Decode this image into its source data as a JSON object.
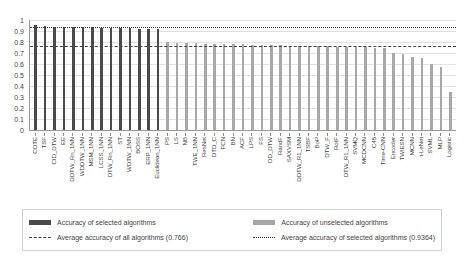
{
  "chart_data": {
    "type": "bar",
    "title": "",
    "xlabel": "",
    "ylabel": "",
    "ylim": [
      0,
      1
    ],
    "grid": true,
    "y_ticks": [
      "1",
      "0.9",
      "0.8",
      "0.7",
      "0.6",
      "0.5",
      "0.4",
      "0.3",
      "0.2",
      "0.1",
      "0"
    ],
    "y_tick_values": [
      1,
      0.9,
      0.8,
      0.7,
      0.6,
      0.5,
      0.4,
      0.3,
      0.2,
      0.1,
      0
    ],
    "categories": [
      "COTE",
      "TSF",
      "CID_DTW",
      "EE",
      "DDTW_Rn_1NN",
      "WDDTW_1NN",
      "MSM_1NN",
      "LCSS_1NN",
      "DTW_Rn_1NN",
      "ST",
      "WDTW_1NN",
      "BOSS",
      "ERP_1NN",
      "Euclidean_1NN",
      "PS",
      "LS",
      "NB",
      "TWE_1NN",
      "ResNet",
      "DTD_C",
      "FCN",
      "BN",
      "ACF",
      "LPS",
      "FS",
      "DD_DTW",
      "RandF",
      "SAXVSM",
      "DDTW_R1_1NN",
      "TSBF",
      "BoP",
      "DTW_F",
      "RotF",
      "DTW_R1_1NN",
      "SVMQ",
      "MCDCNN",
      "C45",
      "Time-CNN",
      "Encoder",
      "TWIESN",
      "MCNN",
      "t-LeNet",
      "SVML",
      "MLP",
      "Logistic"
    ],
    "values": [
      0.955,
      0.945,
      0.94,
      0.938,
      0.936,
      0.934,
      0.932,
      0.93,
      0.928,
      0.926,
      0.924,
      0.922,
      0.92,
      0.918,
      0.8,
      0.795,
      0.79,
      0.788,
      0.786,
      0.784,
      0.782,
      0.78,
      0.778,
      0.776,
      0.774,
      0.772,
      0.77,
      0.768,
      0.766,
      0.764,
      0.762,
      0.76,
      0.758,
      0.756,
      0.754,
      0.752,
      0.75,
      0.748,
      0.7,
      0.695,
      0.66,
      0.655,
      0.6,
      0.57,
      0.35
    ],
    "series": [
      {
        "name": "Accuracy of selected algorithms",
        "color": "#4a4a4a"
      },
      {
        "name": "Accuracy of unselected algorithms",
        "color": "#a8a8a8"
      }
    ],
    "selected_flags": [
      true,
      true,
      true,
      true,
      true,
      true,
      true,
      true,
      true,
      true,
      true,
      true,
      true,
      true,
      false,
      false,
      false,
      false,
      false,
      false,
      false,
      false,
      false,
      false,
      false,
      false,
      false,
      false,
      false,
      false,
      false,
      false,
      false,
      false,
      false,
      false,
      false,
      false,
      false,
      false,
      false,
      false,
      false,
      false,
      false
    ],
    "reference_lines": [
      {
        "name": "Average accuracy of all algorithms",
        "value": 0.766,
        "style": "dash-dot",
        "color": "#454545"
      },
      {
        "name": "Average accuracy of selected algorithms",
        "value": 0.9364,
        "style": "dotted",
        "color": "#3a3a3a"
      }
    ],
    "legend_position": "bottom"
  },
  "legend": {
    "items": [
      {
        "label": "Accuracy of selected algorithms",
        "marker": "bar-dark"
      },
      {
        "label": "Accuracy of unselected algorithms",
        "marker": "bar-light"
      },
      {
        "label": "Average accuracy of all algorithms (0.766)",
        "marker": "line-dash-dot"
      },
      {
        "label": "Average accuracy of selected algorithms (0.9364)",
        "marker": "line-dotted"
      }
    ]
  }
}
